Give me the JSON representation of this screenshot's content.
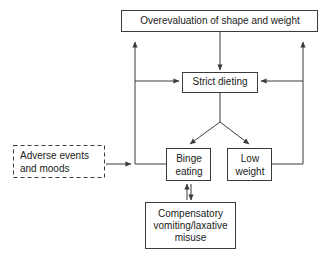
{
  "diagram": {
    "type": "flowchart",
    "background_color": "#ffffff",
    "line_color": "#3b3b3b",
    "text_color": "#1a1a1a",
    "nodes": [
      {
        "id": "overevaluation",
        "label": "Overevaluation of shape and weight",
        "lines": [
          "Overevaluation of shape and weight"
        ],
        "border": "solid",
        "x": 121,
        "y": 10,
        "w": 197,
        "h": 22
      },
      {
        "id": "strict-dieting",
        "label": "Strict dieting",
        "lines": [
          "Strict dieting"
        ],
        "border": "solid",
        "x": 182,
        "y": 72,
        "w": 76,
        "h": 21
      },
      {
        "id": "adverse-events",
        "label": "Adverse events and moods",
        "lines": [
          "Adverse events",
          "and moods"
        ],
        "border": "dashed",
        "x": 13,
        "y": 145,
        "w": 92,
        "h": 33
      },
      {
        "id": "binge-eating",
        "label": "Binge eating",
        "lines": [
          "Binge",
          "eating"
        ],
        "border": "solid",
        "x": 166,
        "y": 148,
        "w": 45,
        "h": 33
      },
      {
        "id": "low-weight",
        "label": "Low weight",
        "lines": [
          "Low",
          "weight"
        ],
        "border": "solid",
        "x": 227,
        "y": 148,
        "w": 45,
        "h": 33
      },
      {
        "id": "compensatory",
        "label": "Compensatory vomiting/laxative misuse",
        "lines": [
          "Compensatory",
          "vomiting/laxative",
          "misuse"
        ],
        "border": "solid",
        "x": 145,
        "y": 202,
        "w": 91,
        "h": 47
      }
    ],
    "edges": [
      {
        "id": "overevaluation-to-strict-dieting",
        "from": "overevaluation",
        "to": "strict-dieting",
        "arrow": "single"
      },
      {
        "id": "strict-dieting-to-binge-eating",
        "from": "strict-dieting",
        "to": "binge-eating",
        "arrow": "single"
      },
      {
        "id": "strict-dieting-to-low-weight",
        "from": "strict-dieting",
        "to": "low-weight",
        "arrow": "single"
      },
      {
        "id": "adverse-events-to-binge-eating",
        "from": "adverse-events",
        "to": "binge-eating",
        "arrow": "single"
      },
      {
        "id": "binge-eating-to-overevaluation",
        "from": "binge-eating",
        "to": "overevaluation",
        "arrow": "single"
      },
      {
        "id": "binge-eating-to-strict-dieting",
        "from": "binge-eating",
        "to": "strict-dieting",
        "arrow": "single"
      },
      {
        "id": "low-weight-to-overevaluation",
        "from": "low-weight",
        "to": "overevaluation",
        "arrow": "single"
      },
      {
        "id": "low-weight-to-strict-dieting",
        "from": "low-weight",
        "to": "strict-dieting",
        "arrow": "single"
      },
      {
        "id": "binge-eating-compensatory",
        "from": "binge-eating",
        "to": "compensatory",
        "arrow": "double"
      }
    ]
  }
}
